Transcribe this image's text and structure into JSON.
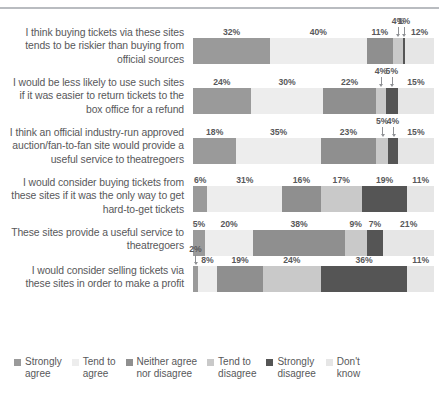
{
  "chart_data": {
    "type": "bar",
    "orientation": "horizontal",
    "stacked": true,
    "title": "",
    "subtitle": "",
    "xlabel": "",
    "ylabel": "",
    "xlim": [
      0,
      100
    ],
    "grid": false,
    "legend_position": "bottom",
    "value_suffix": "%",
    "categories": [
      "I think buying tickets via these sites tends to be riskier than buying from official sources",
      "I would be less likely to use such sites if it was easier to return tickets to the box office for a refund",
      "I think an official industry-run approved auction/fan-to-fan site would provide a useful service to theatregoers",
      "I would consider buying tickets from these sites if it was the only way to get hard-to-get tickets",
      "These sites provide a useful service to theatregoers",
      "I would consider selling tickets via these sites in order to make a profit"
    ],
    "series": [
      {
        "name": "Strongly agree",
        "color": "#9a9a9a",
        "values": [
          32,
          24,
          18,
          6,
          5,
          2
        ]
      },
      {
        "name": "Tend to agree",
        "color": "#ededed",
        "values": [
          40,
          30,
          35,
          31,
          20,
          8
        ]
      },
      {
        "name": "Neither agree nor disagree",
        "color": "#8f8f8f",
        "values": [
          11,
          22,
          23,
          16,
          38,
          19
        ]
      },
      {
        "name": "Tend to disagree",
        "color": "#c9c9c9",
        "values": [
          4,
          4,
          5,
          17,
          9,
          24
        ]
      },
      {
        "name": "Strongly disagree",
        "color": "#555555",
        "values": [
          1,
          5,
          4,
          19,
          7,
          36
        ]
      },
      {
        "name": "Don't know",
        "color": "#e6e6e6",
        "values": [
          12,
          15,
          15,
          11,
          21,
          11
        ]
      }
    ]
  },
  "rows": [
    {
      "label": "I think buying tickets via these sites tends to be riskier than buying from official sources",
      "segments": [
        {
          "name": "Strongly agree",
          "value": "32%",
          "pct": 32,
          "color": "#9a9a9a",
          "callout": false
        },
        {
          "name": "Tend to agree",
          "value": "40%",
          "pct": 40,
          "color": "#ededed",
          "callout": false
        },
        {
          "name": "Neither agree nor disagree",
          "value": "11%",
          "pct": 11,
          "color": "#8f8f8f",
          "callout": false
        },
        {
          "name": "Tend to disagree",
          "value": "4%",
          "pct": 4,
          "color": "#c9c9c9",
          "callout": true
        },
        {
          "name": "Strongly disagree",
          "value": "1%",
          "pct": 1,
          "color": "#555555",
          "callout": true
        },
        {
          "name": "Don't know",
          "value": "12%",
          "pct": 12,
          "color": "#e6e6e6",
          "callout": false
        }
      ]
    },
    {
      "label": "I would be less likely to use such sites if it was easier to return tickets to the box office for a refund",
      "segments": [
        {
          "name": "Strongly agree",
          "value": "24%",
          "pct": 24,
          "color": "#9a9a9a",
          "callout": false
        },
        {
          "name": "Tend to agree",
          "value": "30%",
          "pct": 30,
          "color": "#ededed",
          "callout": false
        },
        {
          "name": "Neither agree nor disagree",
          "value": "22%",
          "pct": 22,
          "color": "#8f8f8f",
          "callout": false
        },
        {
          "name": "Tend to disagree",
          "value": "4%",
          "pct": 4,
          "color": "#c9c9c9",
          "callout": true
        },
        {
          "name": "Strongly disagree",
          "value": "5%",
          "pct": 5,
          "color": "#555555",
          "callout": true
        },
        {
          "name": "Don't know",
          "value": "15%",
          "pct": 15,
          "color": "#e6e6e6",
          "callout": false
        }
      ]
    },
    {
      "label": "I think an official industry-run approved auction/fan-to-fan site would provide a useful service to theatregoers",
      "segments": [
        {
          "name": "Strongly agree",
          "value": "18%",
          "pct": 18,
          "color": "#9a9a9a",
          "callout": false
        },
        {
          "name": "Tend to agree",
          "value": "35%",
          "pct": 35,
          "color": "#ededed",
          "callout": false
        },
        {
          "name": "Neither agree nor disagree",
          "value": "23%",
          "pct": 23,
          "color": "#8f8f8f",
          "callout": false
        },
        {
          "name": "Tend to disagree",
          "value": "5%",
          "pct": 5,
          "color": "#c9c9c9",
          "callout": true
        },
        {
          "name": "Strongly disagree",
          "value": "4%",
          "pct": 4,
          "color": "#555555",
          "callout": true
        },
        {
          "name": "Don't know",
          "value": "15%",
          "pct": 15,
          "color": "#e6e6e6",
          "callout": false
        }
      ]
    },
    {
      "label": "I would consider buying tickets from these sites if it was the only way to get hard-to-get tickets",
      "segments": [
        {
          "name": "Strongly agree",
          "value": "6%",
          "pct": 6,
          "color": "#9a9a9a",
          "callout": false
        },
        {
          "name": "Tend to agree",
          "value": "31%",
          "pct": 31,
          "color": "#ededed",
          "callout": false
        },
        {
          "name": "Neither agree nor disagree",
          "value": "16%",
          "pct": 16,
          "color": "#8f8f8f",
          "callout": false
        },
        {
          "name": "Tend to disagree",
          "value": "17%",
          "pct": 17,
          "color": "#c9c9c9",
          "callout": false
        },
        {
          "name": "Strongly disagree",
          "value": "19%",
          "pct": 19,
          "color": "#555555",
          "callout": false
        },
        {
          "name": "Don't know",
          "value": "11%",
          "pct": 11,
          "color": "#e6e6e6",
          "callout": false
        }
      ]
    },
    {
      "label": "These sites provide a useful service to theatregoers",
      "segments": [
        {
          "name": "Strongly agree",
          "value": "5%",
          "pct": 5,
          "color": "#9a9a9a",
          "callout": false
        },
        {
          "name": "Tend to agree",
          "value": "20%",
          "pct": 20,
          "color": "#ededed",
          "callout": false
        },
        {
          "name": "Neither agree nor disagree",
          "value": "38%",
          "pct": 38,
          "color": "#8f8f8f",
          "callout": false
        },
        {
          "name": "Tend to disagree",
          "value": "9%",
          "pct": 9,
          "color": "#c9c9c9",
          "callout": false
        },
        {
          "name": "Strongly disagree",
          "value": "7%",
          "pct": 7,
          "color": "#555555",
          "callout": false
        },
        {
          "name": "Don't know",
          "value": "21%",
          "pct": 21,
          "color": "#e6e6e6",
          "callout": false
        }
      ]
    },
    {
      "label": "I would consider selling tickets via these sites in order to make a profit",
      "segments": [
        {
          "name": "Strongly agree",
          "value": "2%",
          "pct": 2,
          "color": "#9a9a9a",
          "callout": true
        },
        {
          "name": "Tend to agree",
          "value": "8%",
          "pct": 8,
          "color": "#ededed",
          "callout": false
        },
        {
          "name": "Neither agree nor disagree",
          "value": "19%",
          "pct": 19,
          "color": "#8f8f8f",
          "callout": false
        },
        {
          "name": "Tend to disagree",
          "value": "24%",
          "pct": 24,
          "color": "#c9c9c9",
          "callout": false
        },
        {
          "name": "Strongly disagree",
          "value": "36%",
          "pct": 36,
          "color": "#555555",
          "callout": false
        },
        {
          "name": "Don't know",
          "value": "11%",
          "pct": 11,
          "color": "#e6e6e6",
          "callout": false
        }
      ]
    }
  ],
  "legend": {
    "items": [
      {
        "label": "Strongly\nagree",
        "color": "#9a9a9a"
      },
      {
        "label": "Tend to\nagree",
        "color": "#ededed"
      },
      {
        "label": "Neither agree\nnor disagree",
        "color": "#8f8f8f"
      },
      {
        "label": "Tend to\ndisagree",
        "color": "#c9c9c9"
      },
      {
        "label": "Strongly\ndisagree",
        "color": "#555555"
      },
      {
        "label": "Don't\nknow",
        "color": "#e6e6e6"
      }
    ]
  }
}
